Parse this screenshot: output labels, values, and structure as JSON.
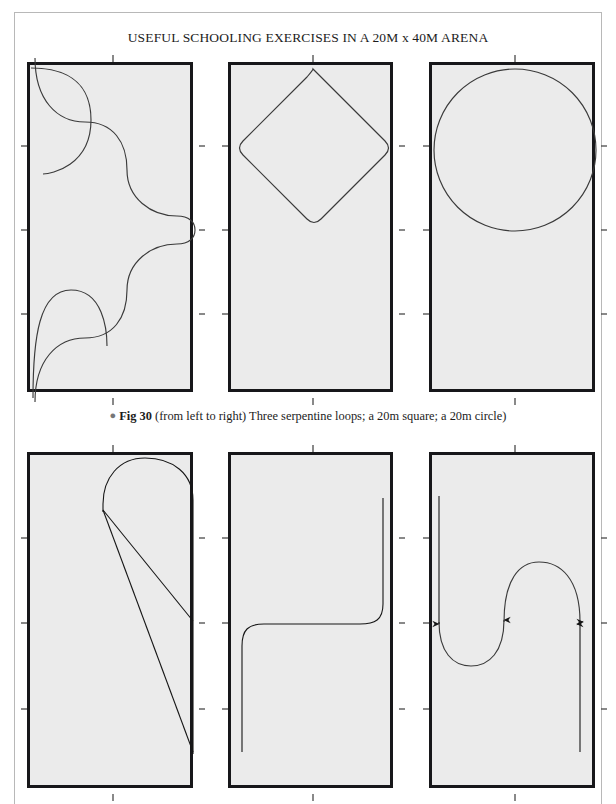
{
  "page": {
    "title": "USEFUL SCHOOLING EXERCISES IN A 20M x 40M ARENA",
    "background_color": "#ffffff",
    "frame_color": "#b8b8b8"
  },
  "caption": {
    "bullet": "●",
    "figure_number": "Fig 30",
    "text": "(from left to right) Three serpentine loops; a 20m square; a 20m circle)"
  },
  "arena_style": {
    "fill_color": "#ebebeb",
    "border_color": "#17171a",
    "path_color": "#3a3a3a",
    "tick_color": "#4a4a4a"
  },
  "diagrams": [
    {
      "id": "serpentine-loops",
      "row": 1,
      "column": 1,
      "label": "Three serpentine loops",
      "description": "S-shaped serpentine path with three loops spanning the arena width"
    },
    {
      "id": "square-20m",
      "row": 1,
      "column": 2,
      "label": "a 20m square",
      "description": "A 20m square ridden on the diagonal forming a diamond in the top half of the arena"
    },
    {
      "id": "circle-20m",
      "row": 1,
      "column": 3,
      "label": "a 20m circle",
      "description": "A 20m circle filling the width of the arena in the top half"
    },
    {
      "id": "half-circle-return",
      "row": 2,
      "column": 1,
      "label": "Half circle returning to the track",
      "description": "Half circle at the top of the arena with two long diagonal return lines to the track"
    },
    {
      "id": "change-rein-diagonal",
      "row": 2,
      "column": 2,
      "label": "Change of rein across the centre",
      "description": "S-shaped path with rounded corners crossing the arena at the centre line"
    },
    {
      "id": "figure-eight-arrows",
      "row": 2,
      "column": 3,
      "label": "Figure of eight with direction of travel",
      "description": "Two joined half circles forming a serpentine with arrows showing direction of travel"
    }
  ]
}
